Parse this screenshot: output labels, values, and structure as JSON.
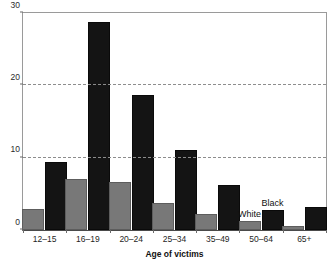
{
  "chart_data": {
    "type": "bar",
    "title": "",
    "subtitle": "",
    "xlabel": "Age of victims",
    "ylabel": "",
    "categories": [
      "12–15",
      "16–19",
      "20–24",
      "25–34",
      "35–49",
      "50–64",
      "65+"
    ],
    "series": [
      {
        "name": "White",
        "color": "#787878",
        "values": [
          2.9,
          7.1,
          6.6,
          3.7,
          2.2,
          1.2,
          0.5
        ]
      },
      {
        "name": "Black",
        "color": "#141414",
        "values": [
          9.4,
          28.8,
          18.6,
          11.1,
          6.2,
          2.8,
          3.2
        ]
      }
    ],
    "ylim": [
      0,
      30
    ],
    "yticks": [
      0,
      10,
      20,
      30
    ],
    "ytick_labels": [
      "0",
      "10",
      "20",
      "30"
    ],
    "gridlines": [
      10,
      20
    ],
    "grid": "horizontal-dashed",
    "legend": "inline-annotations",
    "annotations": [
      {
        "text": "White",
        "series": "White",
        "category": "50–64"
      },
      {
        "text": "Black",
        "series": "Black",
        "category": "50–64"
      }
    ]
  }
}
